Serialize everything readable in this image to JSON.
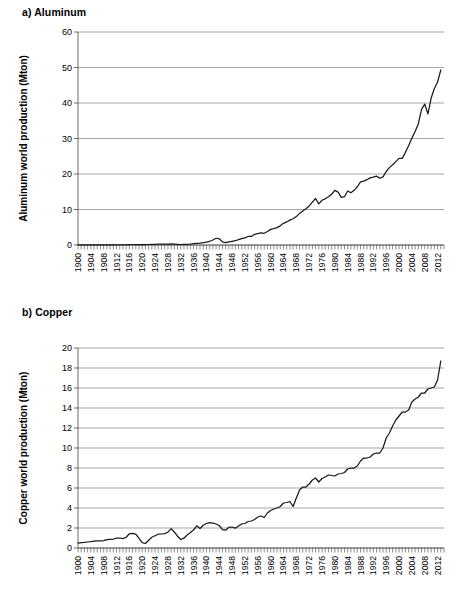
{
  "figure": {
    "panels": [
      {
        "id": "aluminum",
        "label": "a) Aluminum"
      },
      {
        "id": "copper",
        "label": "b) Copper"
      }
    ]
  },
  "chart_data": [
    {
      "type": "line",
      "title": "a) Aluminum",
      "xlabel": "",
      "ylabel": "Aluminum world production (Mton)",
      "xlim": [
        1900,
        2014
      ],
      "ylim": [
        0,
        60
      ],
      "yticks": [
        0,
        10,
        20,
        30,
        40,
        50,
        60
      ],
      "ytick_labels": [
        "0",
        "10",
        "20",
        "30",
        "40",
        "50",
        "60"
      ],
      "xticks": [
        1900,
        1904,
        1908,
        1912,
        1916,
        1920,
        1924,
        1928,
        1932,
        1936,
        1940,
        1944,
        1948,
        1952,
        1956,
        1960,
        1964,
        1968,
        1972,
        1976,
        1980,
        1984,
        1988,
        1992,
        1996,
        2000,
        2004,
        2008,
        2012
      ],
      "xtick_labels": [
        "1900",
        "1904",
        "1908",
        "1912",
        "1916",
        "1920",
        "1924",
        "1928",
        "1932",
        "1936",
        "1940",
        "1944",
        "1948",
        "1952",
        "1956",
        "1960",
        "1964",
        "1968",
        "1972",
        "1976",
        "1980",
        "1984",
        "1988",
        "1992",
        "1996",
        "2000",
        "2004",
        "2008",
        "2012"
      ],
      "xtick_minor_step": 1,
      "grid": "horizontal",
      "legend": "none",
      "line_color": "#1a1a1a",
      "x": [
        1900,
        1901,
        1902,
        1903,
        1904,
        1905,
        1906,
        1907,
        1908,
        1909,
        1910,
        1911,
        1912,
        1913,
        1914,
        1915,
        1916,
        1917,
        1918,
        1919,
        1920,
        1921,
        1922,
        1923,
        1924,
        1925,
        1926,
        1927,
        1928,
        1929,
        1930,
        1931,
        1932,
        1933,
        1934,
        1935,
        1936,
        1937,
        1938,
        1939,
        1940,
        1941,
        1942,
        1943,
        1944,
        1945,
        1946,
        1947,
        1948,
        1949,
        1950,
        1951,
        1952,
        1953,
        1954,
        1955,
        1956,
        1957,
        1958,
        1959,
        1960,
        1961,
        1962,
        1963,
        1964,
        1965,
        1966,
        1967,
        1968,
        1969,
        1970,
        1971,
        1972,
        1973,
        1974,
        1975,
        1976,
        1977,
        1978,
        1979,
        1980,
        1981,
        1982,
        1983,
        1984,
        1985,
        1986,
        1987,
        1988,
        1989,
        1990,
        1991,
        1992,
        1993,
        1994,
        1995,
        1996,
        1997,
        1998,
        1999,
        2000,
        2001,
        2002,
        2003,
        2004,
        2005,
        2006,
        2007,
        2008,
        2009,
        2010,
        2011,
        2012,
        2013
      ],
      "y": [
        0.007,
        0.008,
        0.01,
        0.012,
        0.013,
        0.014,
        0.015,
        0.017,
        0.018,
        0.02,
        0.045,
        0.047,
        0.06,
        0.07,
        0.07,
        0.08,
        0.12,
        0.14,
        0.14,
        0.13,
        0.13,
        0.1,
        0.14,
        0.18,
        0.2,
        0.22,
        0.24,
        0.26,
        0.28,
        0.3,
        0.27,
        0.2,
        0.14,
        0.16,
        0.18,
        0.25,
        0.36,
        0.49,
        0.56,
        0.68,
        0.82,
        1.05,
        1.4,
        1.9,
        1.75,
        0.9,
        0.65,
        0.85,
        1.05,
        1.2,
        1.5,
        1.8,
        2.0,
        2.4,
        2.4,
        3.0,
        3.2,
        3.4,
        3.3,
        3.8,
        4.4,
        4.6,
        4.9,
        5.4,
        6.1,
        6.5,
        7.0,
        7.4,
        8.0,
        8.9,
        9.6,
        10.2,
        11.0,
        12.1,
        13.1,
        11.6,
        12.6,
        13.0,
        13.6,
        14.3,
        15.4,
        14.9,
        13.4,
        13.6,
        15.2,
        14.7,
        15.4,
        16.4,
        17.8,
        18.0,
        18.4,
        18.9,
        19.1,
        19.4,
        18.8,
        19.2,
        20.7,
        21.8,
        22.6,
        23.5,
        24.4,
        24.4,
        26.1,
        28.0,
        30.1,
        32.0,
        34.1,
        38.2,
        39.7,
        36.9,
        41.4,
        44.1,
        45.9,
        49.3
      ]
    },
    {
      "type": "line",
      "title": "b) Copper",
      "xlabel": "",
      "ylabel": "Copper world production (Mton)",
      "xlim": [
        1900,
        2014
      ],
      "ylim": [
        0,
        20
      ],
      "yticks": [
        0,
        2,
        4,
        6,
        8,
        10,
        12,
        14,
        16,
        18,
        20
      ],
      "ytick_labels": [
        "0",
        "2",
        "4",
        "6",
        "8",
        "10",
        "12",
        "14",
        "16",
        "18",
        "20"
      ],
      "xticks": [
        1900,
        1904,
        1908,
        1912,
        1916,
        1920,
        1924,
        1928,
        1932,
        1936,
        1940,
        1944,
        1948,
        1952,
        1956,
        1960,
        1964,
        1968,
        1972,
        1976,
        1980,
        1984,
        1988,
        1992,
        1996,
        2000,
        2004,
        2008,
        2012
      ],
      "xtick_labels": [
        "1900",
        "1904",
        "1908",
        "1912",
        "1916",
        "1920",
        "1924",
        "1928",
        "1932",
        "1936",
        "1940",
        "1944",
        "1948",
        "1952",
        "1956",
        "1960",
        "1964",
        "1968",
        "1972",
        "1976",
        "1980",
        "1984",
        "1988",
        "1992",
        "1996",
        "2000",
        "2004",
        "2008",
        "2012"
      ],
      "xtick_minor_step": 1,
      "grid": "horizontal",
      "legend": "none",
      "line_color": "#1a1a1a",
      "x": [
        1900,
        1901,
        1902,
        1903,
        1904,
        1905,
        1906,
        1907,
        1908,
        1909,
        1910,
        1911,
        1912,
        1913,
        1914,
        1915,
        1916,
        1917,
        1918,
        1919,
        1920,
        1921,
        1922,
        1923,
        1924,
        1925,
        1926,
        1927,
        1928,
        1929,
        1930,
        1931,
        1932,
        1933,
        1934,
        1935,
        1936,
        1937,
        1938,
        1939,
        1940,
        1941,
        1942,
        1943,
        1944,
        1945,
        1946,
        1947,
        1948,
        1949,
        1950,
        1951,
        1952,
        1953,
        1954,
        1955,
        1956,
        1957,
        1958,
        1959,
        1960,
        1961,
        1962,
        1963,
        1964,
        1965,
        1966,
        1967,
        1968,
        1969,
        1970,
        1971,
        1972,
        1973,
        1974,
        1975,
        1976,
        1977,
        1978,
        1979,
        1980,
        1981,
        1982,
        1983,
        1984,
        1985,
        1986,
        1987,
        1988,
        1989,
        1990,
        1991,
        1992,
        1993,
        1994,
        1995,
        1996,
        1997,
        1998,
        1999,
        2000,
        2001,
        2002,
        2003,
        2004,
        2005,
        2006,
        2007,
        2008,
        2009,
        2010,
        2011,
        2012,
        2013
      ],
      "y": [
        0.49,
        0.53,
        0.56,
        0.6,
        0.63,
        0.69,
        0.72,
        0.72,
        0.73,
        0.83,
        0.87,
        0.89,
        1.0,
        1.0,
        0.94,
        1.08,
        1.42,
        1.46,
        1.38,
        0.96,
        0.53,
        0.45,
        0.78,
        1.08,
        1.23,
        1.38,
        1.4,
        1.44,
        1.58,
        1.94,
        1.6,
        1.18,
        0.85,
        0.98,
        1.3,
        1.56,
        1.8,
        2.22,
        1.95,
        2.28,
        2.45,
        2.53,
        2.48,
        2.4,
        2.25,
        1.83,
        1.78,
        2.07,
        2.1,
        1.98,
        2.2,
        2.41,
        2.45,
        2.65,
        2.7,
        2.85,
        3.1,
        3.2,
        3.05,
        3.5,
        3.75,
        3.9,
        4.0,
        4.15,
        4.5,
        4.55,
        4.65,
        4.15,
        5.0,
        5.8,
        6.1,
        6.1,
        6.4,
        6.8,
        7.0,
        6.6,
        6.95,
        7.1,
        7.3,
        7.25,
        7.2,
        7.4,
        7.45,
        7.55,
        7.9,
        8.0,
        8.0,
        8.2,
        8.7,
        9.0,
        9.0,
        9.1,
        9.4,
        9.5,
        9.5,
        10.0,
        11.0,
        11.5,
        12.2,
        12.8,
        13.2,
        13.6,
        13.6,
        13.8,
        14.6,
        14.9,
        15.1,
        15.5,
        15.5,
        15.9,
        16.0,
        16.1,
        16.8,
        18.7
      ]
    }
  ]
}
